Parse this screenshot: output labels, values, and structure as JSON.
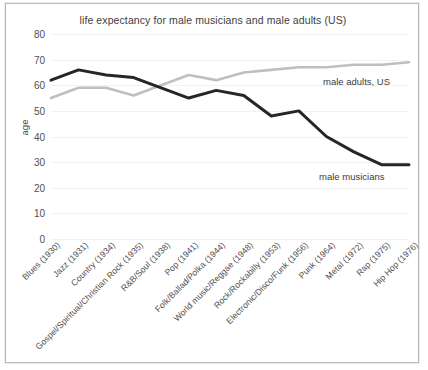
{
  "chart_data": {
    "type": "line",
    "title": "life expectancy for male musicians and male adults (US)",
    "xlabel": "",
    "ylabel": "age",
    "ylim": [
      0,
      80
    ],
    "ytick_step": 10,
    "yticks": [
      80,
      70,
      60,
      50,
      40,
      30,
      20,
      10,
      0
    ],
    "grid": true,
    "legend_position": "inline-annotation",
    "categories": [
      "Blues (1930)",
      "Jazz (1931)",
      "Country (1934)",
      "Gospel/Spiritual/Christian Rock (1935)",
      "R&B/Soul (1938)",
      "Pop (1941)",
      "Folk/Ballad/Polka (1944)",
      "World music/Reggae (1948)",
      "Rock/Rockabilly (1953)",
      "Electronic/Disco/Funk (1956)",
      "Punk (1964)",
      "Metal (1972)",
      "Rap (1975)",
      "Hip Hop (1976)"
    ],
    "series": [
      {
        "name": "male musicians",
        "color": "#262626",
        "values": [
          62,
          66,
          64,
          63,
          59,
          55,
          58,
          56,
          48,
          50,
          40,
          34,
          29,
          29
        ]
      },
      {
        "name": "male adults, US",
        "color": "#bfbfbf",
        "values": [
          55,
          59,
          59,
          56,
          60,
          64,
          62,
          65,
          66,
          67,
          67,
          68,
          68,
          69
        ]
      }
    ],
    "annotations": [
      {
        "text": "male adults, US",
        "series": "male adults, US"
      },
      {
        "text": "male musicians",
        "series": "male musicians"
      }
    ]
  }
}
